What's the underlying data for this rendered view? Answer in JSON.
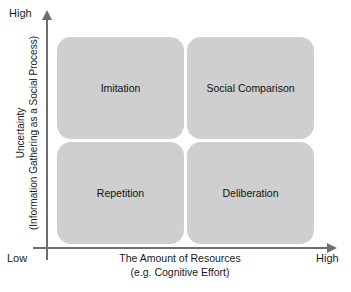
{
  "chart_data": {
    "type": "table",
    "title": "",
    "xlabel": "The Amount of Resources (e.g. Cognitive Effort)",
    "ylabel": "Uncertainty (Information Gathering as a Social Process)",
    "x_axis_ticks": [
      "Low",
      "High"
    ],
    "y_axis_ticks": [
      "Low",
      "High"
    ],
    "grid": false,
    "legend": "none",
    "categories_x": [
      "Low Resources",
      "High Resources"
    ],
    "categories_y": [
      "High Uncertainty",
      "Low Uncertainty"
    ],
    "cells": [
      {
        "x": "Low Resources",
        "y": "High Uncertainty",
        "label": "Imitation"
      },
      {
        "x": "High Resources",
        "y": "High Uncertainty",
        "label": "Social Comparison"
      },
      {
        "x": "Low Resources",
        "y": "Low Uncertainty",
        "label": "Repetition"
      },
      {
        "x": "High Resources",
        "y": "Low Uncertainty",
        "label": "Deliberation"
      }
    ]
  },
  "axes": {
    "y": {
      "title_line1": "Uncertainty",
      "title_line2": "(Information Gathering as a Social Process)",
      "high_label": "High",
      "low_label": "Low"
    },
    "x": {
      "title_line1": "The Amount of Resources",
      "title_line2": "(e.g. Cognitive Effort)",
      "high_label": "High"
    }
  },
  "quadrants": [
    {
      "label": "Imitation"
    },
    {
      "label": "Social Comparison"
    },
    {
      "label": "Repetition"
    },
    {
      "label": "Deliberation"
    }
  ],
  "colors": {
    "quadrant_fill": "#cfcfcf",
    "axis": "#6e6e6e",
    "text": "#1a1a1a",
    "background": "#ffffff"
  }
}
